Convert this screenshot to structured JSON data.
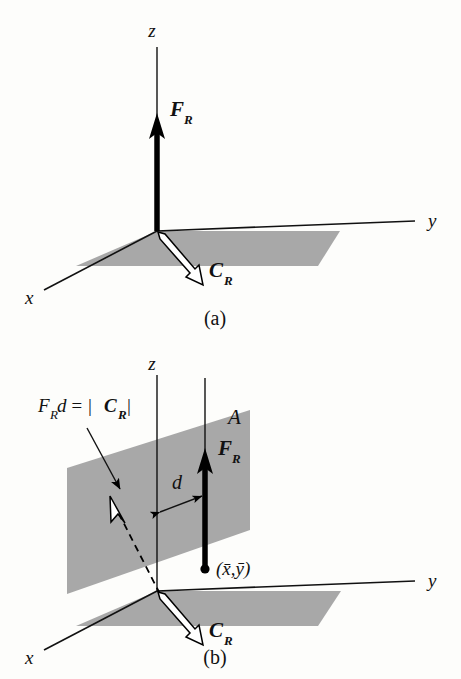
{
  "figure": {
    "background_color": "#fdfdfb",
    "plane_fill": "#a8a8a8",
    "ink_color": "#111111"
  },
  "panel_a": {
    "caption": "(a)",
    "axes": {
      "x": "x",
      "y": "y",
      "z": "z"
    },
    "labels": {
      "force": "F",
      "force_sub": "R",
      "couple": "C",
      "couple_sub": "R"
    }
  },
  "panel_b": {
    "caption": "(b)",
    "axes": {
      "x": "x",
      "y": "y",
      "z": "z"
    },
    "labels": {
      "force": "F",
      "force_sub": "R",
      "couple": "C",
      "couple_sub": "R",
      "plane": "A",
      "distance": "d",
      "centroid": "(x̄,ȳ)",
      "moment_eq_lead": "F",
      "moment_eq_lead_sub": "R",
      "moment_eq_mid": "d = |",
      "moment_eq_bold": "C",
      "moment_eq_bold_sub": "R",
      "moment_eq_tail": "|"
    }
  }
}
